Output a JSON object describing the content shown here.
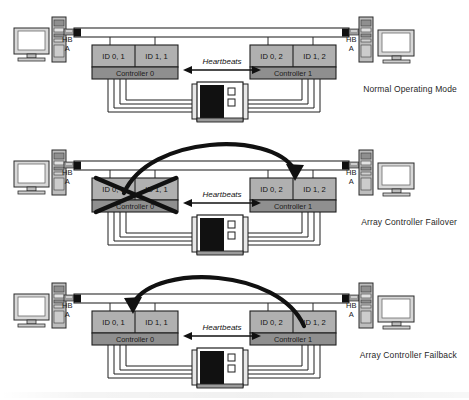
{
  "figure": {
    "panel_count": 3
  },
  "colors": {
    "id_cell_fill": "#b0b0b0",
    "controller_bar_fill": "#8f8f8f",
    "bus_fill": "#ffffff",
    "bus_stroke": "#2b2b2b",
    "terminator_fill": "#111111",
    "arrow_fill": "#111111",
    "enclosure_panel": "#111111",
    "text": "#1a1a1a",
    "monitor_fill": "#d8d8d8",
    "tower_fill": "#bdbdbd"
  },
  "labels": {
    "hb": "HB",
    "hb_bus": "A",
    "heartbeats": "Heartbeats"
  },
  "panels": [
    {
      "id": "normal-operating-mode",
      "caption": "Normal Operating Mode",
      "controller_left": {
        "name": "Controller 0",
        "ids": [
          "ID 0, 1",
          "ID 1, 1"
        ],
        "failed": false
      },
      "controller_right": {
        "name": "Controller 1",
        "ids": [
          "ID 0, 2",
          "ID 1, 2"
        ],
        "failed": false
      },
      "failover_arrow": "none",
      "heartbeats": "Heartbeats",
      "hosts": [
        "HB",
        "A"
      ]
    },
    {
      "id": "array-controller-failover",
      "caption": "Array Controller Failover",
      "controller_left": {
        "name": "Controller 0",
        "ids": [
          "ID 0, 1",
          "ID 1, 1"
        ],
        "failed": true
      },
      "controller_right": {
        "name": "Controller 1",
        "ids": [
          "ID 0, 2",
          "ID 1, 2"
        ],
        "failed": false
      },
      "failover_arrow": "left-to-right",
      "heartbeats": "Heartbeats",
      "hosts": [
        "HB",
        "A"
      ]
    },
    {
      "id": "array-controller-failback",
      "caption": "Array Controller Failback",
      "controller_left": {
        "name": "Controller 0",
        "ids": [
          "ID 0, 1",
          "ID 1, 1"
        ],
        "failed": false
      },
      "controller_right": {
        "name": "Controller 1",
        "ids": [
          "ID 0, 2",
          "ID 1, 2"
        ],
        "failed": false
      },
      "failover_arrow": "right-to-left",
      "heartbeats": "Heartbeats",
      "hosts": [
        "HB",
        "A"
      ]
    }
  ]
}
